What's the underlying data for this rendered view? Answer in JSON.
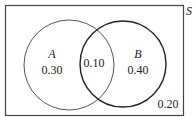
{
  "diagram": {
    "type": "venn",
    "universe_label": "S",
    "sets": [
      {
        "name": "A",
        "only_value": "0.30"
      },
      {
        "name": "B",
        "only_value": "0.40"
      }
    ],
    "intersection_value": "0.10",
    "outside_value": "0.20",
    "colors": {
      "stroke": "#333333",
      "background": "#ffffff",
      "text": "#222222"
    }
  }
}
